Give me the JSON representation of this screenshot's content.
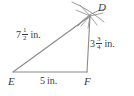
{
  "figure": {
    "name": "triangle-DEF-with-compass-arcs",
    "background_color": "#ffffff",
    "stroke_color": "#808080",
    "text_color": "#3b3b3b"
  },
  "vertices": [
    {
      "id": "D",
      "label": "D",
      "x": 90,
      "y": 16
    },
    {
      "id": "E",
      "label": "E",
      "x": 13,
      "y": 72
    },
    {
      "id": "F",
      "label": "F",
      "x": 87,
      "y": 72
    }
  ],
  "sides": [
    {
      "id": "DE",
      "from": "E",
      "to": "D",
      "measure": {
        "whole": "7",
        "numerator": "1",
        "denominator": "2",
        "unit": "in."
      }
    },
    {
      "id": "DF",
      "from": "F",
      "to": "D",
      "measure": {
        "whole": "3",
        "numerator": "3",
        "denominator": "4",
        "unit": "in."
      }
    },
    {
      "id": "EF",
      "from": "E",
      "to": "F",
      "measure": {
        "whole": "5",
        "numerator": "",
        "denominator": "",
        "unit": "in."
      }
    }
  ],
  "construction_marks": {
    "description": "compass-arcs-intersecting-at-D",
    "count": 2
  }
}
